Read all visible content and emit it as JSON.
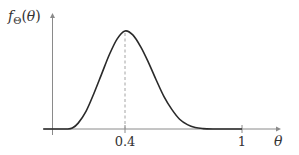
{
  "chart_data": {
    "type": "line",
    "title": "",
    "xlabel": "θ",
    "ylabel": "f_Θ(θ)",
    "ylabel_display": "fΘ(θ)",
    "xlim": [
      0,
      1.2
    ],
    "ylim": [
      0,
      1.05
    ],
    "xticks": [
      {
        "value": 0.4,
        "label": "0.4"
      },
      {
        "value": 1,
        "label": "1"
      }
    ],
    "annotations": [
      {
        "type": "dashed-vertical-line",
        "x": 0.4,
        "description": "mode of density"
      }
    ],
    "series": [
      {
        "name": "density",
        "x": [
          -0.02,
          0.05,
          0.1,
          0.13,
          0.16,
          0.2,
          0.24,
          0.28,
          0.32,
          0.36,
          0.4,
          0.44,
          0.48,
          0.52,
          0.56,
          0.6,
          0.64,
          0.68,
          0.72,
          0.76,
          0.8,
          0.85,
          0.9,
          1.0
        ],
        "values": [
          0,
          0,
          0.0,
          0.01,
          0.06,
          0.18,
          0.36,
          0.56,
          0.76,
          0.92,
          1.0,
          0.96,
          0.84,
          0.68,
          0.5,
          0.33,
          0.2,
          0.1,
          0.045,
          0.015,
          0.004,
          0.0,
          0,
          0
        ]
      }
    ],
    "grid": false,
    "legend": "none"
  }
}
